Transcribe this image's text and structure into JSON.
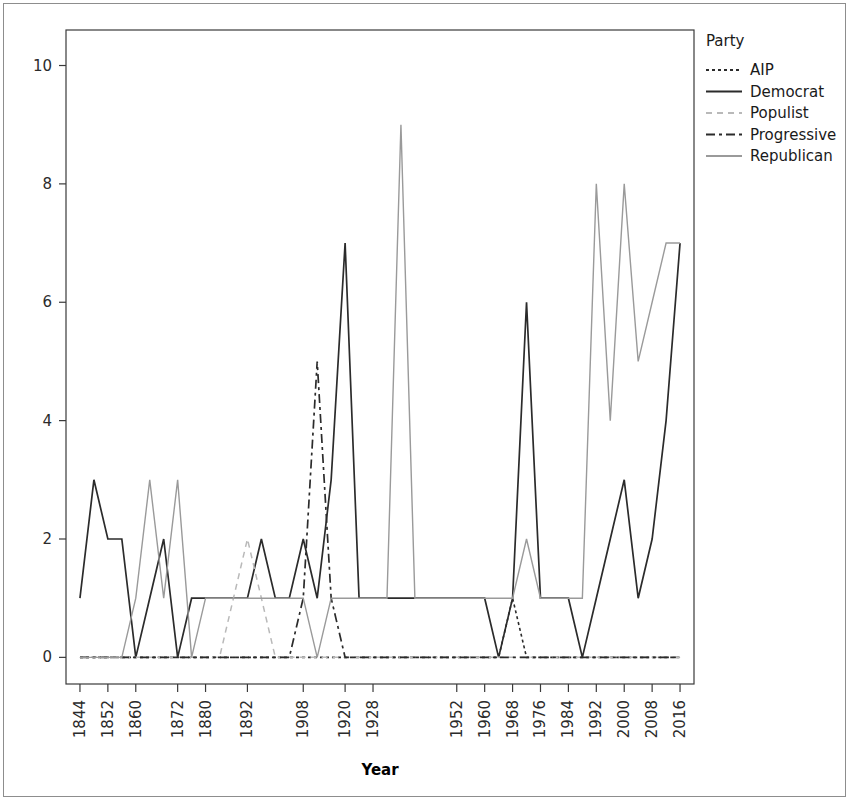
{
  "chart_data": {
    "type": "line",
    "title": "",
    "xlabel": "Year",
    "ylabel": "",
    "legend_title": "Party",
    "legend_position": "right",
    "grid": false,
    "xlim": [
      1840,
      2020
    ],
    "ylim": [
      -0.45,
      10.6
    ],
    "yticks": [
      0,
      2,
      4,
      6,
      8,
      10
    ],
    "ytick_labels": [
      "0",
      "2",
      "4",
      "6",
      "8",
      "10"
    ],
    "xticks": [
      1844,
      1852,
      1860,
      1872,
      1880,
      1892,
      1908,
      1920,
      1928,
      1952,
      1960,
      1968,
      1976,
      1984,
      1992,
      2000,
      2008,
      2016
    ],
    "xtick_labels": [
      "1844",
      "1852",
      "1860",
      "1872",
      "1880",
      "1892",
      "1908",
      "1920",
      "1928",
      "1952",
      "1960",
      "1968",
      "1976",
      "1984",
      "1992",
      "2000",
      "2008",
      "2016"
    ],
    "x": [
      1844,
      1848,
      1852,
      1856,
      1860,
      1864,
      1868,
      1872,
      1876,
      1880,
      1884,
      1888,
      1892,
      1896,
      1900,
      1904,
      1908,
      1912,
      1916,
      1920,
      1924,
      1928,
      1932,
      1936,
      1940,
      1944,
      1948,
      1952,
      1956,
      1960,
      1964,
      1968,
      1972,
      1976,
      1980,
      1984,
      1988,
      1992,
      1996,
      2000,
      2004,
      2008,
      2012,
      2016
    ],
    "series": [
      {
        "name": "AIP",
        "color": "#2b2b2b",
        "dash": "3,3",
        "width": 1.6,
        "values": [
          0,
          0,
          0,
          0,
          0,
          0,
          0,
          0,
          0,
          0,
          0,
          0,
          0,
          0,
          0,
          0,
          0,
          0,
          0,
          0,
          0,
          0,
          0,
          0,
          0,
          0,
          0,
          0,
          0,
          0,
          0,
          1,
          0,
          0,
          0,
          0,
          0,
          0,
          0,
          0,
          0,
          0,
          0,
          0
        ]
      },
      {
        "name": "Democrat",
        "color": "#2b2b2b",
        "dash": "none",
        "width": 1.7,
        "values": [
          1,
          3,
          2,
          2,
          0,
          1,
          2,
          0,
          1,
          1,
          1,
          1,
          1,
          2,
          1,
          1,
          2,
          1,
          3,
          7,
          1,
          1,
          1,
          1,
          1,
          1,
          1,
          1,
          1,
          1,
          0,
          1,
          6,
          1,
          1,
          1,
          0,
          1,
          2,
          3,
          1,
          2,
          4,
          7
        ]
      },
      {
        "name": "Populist",
        "color": "#b9b9b9",
        "dash": "6,5",
        "width": 1.5,
        "values": [
          0,
          0,
          0,
          0,
          0,
          0,
          0,
          0,
          0,
          0,
          0,
          1,
          2,
          1,
          0,
          0,
          0,
          0,
          0,
          0,
          0,
          0,
          0,
          0,
          0,
          0,
          0,
          0,
          0,
          0,
          0,
          0,
          0,
          0,
          0,
          0,
          0,
          0,
          0,
          0,
          0,
          0,
          0,
          0
        ]
      },
      {
        "name": "Progressive",
        "color": "#2b2b2b",
        "dash": "9,4,3,4",
        "width": 1.7,
        "values": [
          0,
          0,
          0,
          0,
          0,
          0,
          0,
          0,
          0,
          0,
          0,
          0,
          0,
          0,
          0,
          0,
          1,
          5,
          1,
          0,
          0,
          0,
          0,
          0,
          0,
          0,
          0,
          0,
          0,
          0,
          0,
          0,
          0,
          0,
          0,
          0,
          0,
          0,
          0,
          0,
          0,
          0,
          0,
          0
        ]
      },
      {
        "name": "Republican",
        "color": "#9a9a9a",
        "dash": "none",
        "width": 1.4,
        "values": [
          0,
          0,
          0,
          0,
          1,
          3,
          1,
          3,
          0,
          1,
          1,
          1,
          1,
          1,
          1,
          1,
          1,
          0,
          1,
          1,
          1,
          1,
          1,
          9,
          1,
          1,
          1,
          1,
          1,
          1,
          1,
          1,
          2,
          1,
          1,
          1,
          1,
          8,
          4,
          8,
          5,
          6,
          7,
          7
        ]
      }
    ]
  },
  "legend": {
    "title": "Party",
    "items": [
      {
        "label": "AIP"
      },
      {
        "label": "Democrat"
      },
      {
        "label": "Populist"
      },
      {
        "label": "Progressive"
      },
      {
        "label": "Republican"
      }
    ]
  },
  "axes": {
    "x_title": "Year"
  }
}
